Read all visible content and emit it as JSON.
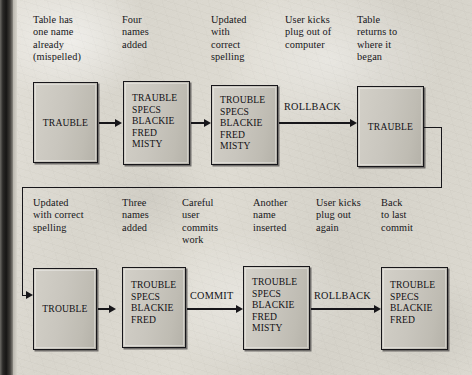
{
  "figure": {
    "background_color": "#d8d5cc",
    "ink_color": "#17161a",
    "box_fill_color": "#c9c6be"
  },
  "rows": [
    {
      "id": "top-row",
      "captions": [
        "Table has\none name\nalready\n(mispelled)",
        "Four\nnames\nadded",
        "Updated\nwith\ncorrect\nspelling",
        "User kicks\nplug out of\ncomputer",
        "Table\nreturns to\nwhere it\nbegan"
      ],
      "boxes": [
        {
          "label": "TRAUBLE",
          "align": "center"
        },
        {
          "label": "TRAUBLE\nSPECS\nBLACKIE\nFRED\nMISTY",
          "align": "left"
        },
        {
          "label": "TROUBLE\nSPECS\nBLACKIE\nFRED\nMISTY",
          "align": "left"
        },
        {
          "label": "TRAUBLE",
          "align": "center"
        }
      ],
      "operations": [
        "ROLLBACK"
      ]
    },
    {
      "id": "bottom-row",
      "captions": [
        "Updated\nwith correct\nspelling",
        "Three\nnames\nadded",
        "Careful\nuser\ncommits\nwork",
        "Another\nname\ninserted",
        "User kicks\nplug out\nagain",
        "Back\nto last\ncommit"
      ],
      "boxes": [
        {
          "label": "TROUBLE",
          "align": "center"
        },
        {
          "label": "TROUBLE\nSPECS\nBLACKIE\nFRED",
          "align": "left"
        },
        {
          "label": "TROUBLE\nSPECS\nBLACKIE\nFRED\nMISTY",
          "align": "left"
        },
        {
          "label": "TROUBLE\nSPECS\nBLACKIE\nFRED",
          "align": "left"
        }
      ],
      "operations": [
        "COMMIT",
        "ROLLBACK"
      ]
    }
  ]
}
